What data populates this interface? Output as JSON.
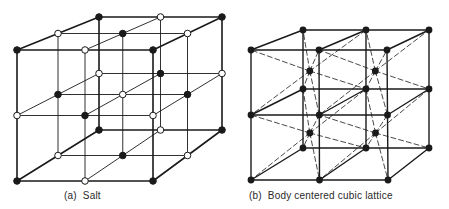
{
  "figure": {
    "panels": [
      {
        "id": "a",
        "caption": "(a)  Salt",
        "structure": "rock-salt (NaCl) cubic lattice, 3x3x3 lattice points",
        "atom_types": [
          {
            "name": "filled",
            "color": "#1a1a1a"
          },
          {
            "name": "hollow",
            "color": "#ffffff",
            "stroke": "#1a1a1a"
          }
        ]
      },
      {
        "id": "b",
        "caption": "(b)  Body centered cubic lattice",
        "structure": "body centered cubic, 2x2x2 cells with dashed body diagonals",
        "atom_types": [
          {
            "name": "filled",
            "color": "#1a1a1a"
          }
        ]
      }
    ],
    "colors": {
      "line": "#1a1a1a",
      "background": "#ffffff"
    }
  }
}
